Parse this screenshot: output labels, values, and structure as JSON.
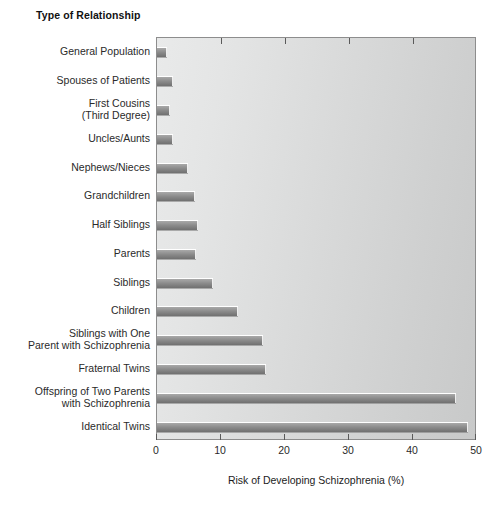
{
  "chart_data": {
    "type": "bar",
    "orientation": "horizontal",
    "title": "",
    "xlabel": "Risk of Developing Schizophrenia (%)",
    "ylabel": "Type of Relationship",
    "xlim": [
      0,
      50
    ],
    "xticks": [
      0,
      10,
      20,
      30,
      40,
      50
    ],
    "xtick_labels": [
      "0",
      "10",
      "20",
      "30",
      "40",
      "50"
    ],
    "grid": false,
    "legend": null,
    "categories": [
      "General Population",
      "Spouses of Patients",
      "First Cousins\n(Third Degree)",
      "Uncles/Aunts",
      "Nephews/Nieces",
      "Grandchildren",
      "Half Siblings",
      "Parents",
      "Siblings",
      "Children",
      "Siblings with One\nParent with Schizophrenia",
      "Fraternal Twins",
      "Offspring of Two Parents\nwith Schizophrenia",
      "Identical Twins"
    ],
    "values": [
      1.5,
      2.5,
      2.0,
      2.5,
      4.9,
      6.0,
      6.4,
      6.1,
      8.8,
      12.7,
      16.5,
      17.0,
      46.7,
      48.6
    ],
    "colors": {
      "bar_top": "#a9a9a9",
      "bar_bottom": "#707070",
      "plot_background_left": "#e9eaea",
      "plot_background_right": "#c8c9c9",
      "frame": "#8d8d8d",
      "text": "#1a1a1a"
    }
  },
  "labels": {
    "y_axis_title": "Type of Relationship",
    "x_axis_title": "Risk of Developing Schizophrenia (%)"
  }
}
